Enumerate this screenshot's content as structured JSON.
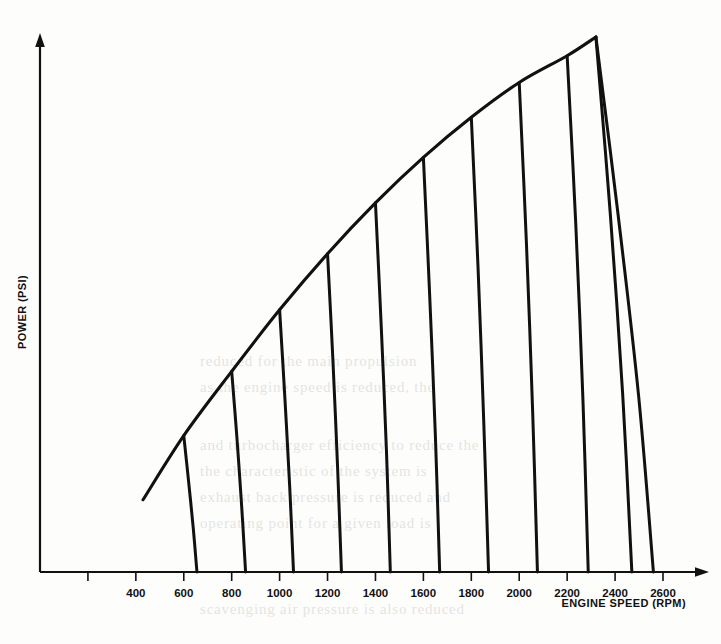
{
  "chart_data": {
    "type": "line",
    "title": "",
    "xlabel": "ENGINE SPEED (RPM)",
    "ylabel": "POWER (PSI)",
    "xlim": [
      0,
      2800
    ],
    "ylim": [
      0,
      100
    ],
    "grid": false,
    "legend": null,
    "xticks": [
      200,
      400,
      600,
      800,
      1000,
      1200,
      1400,
      1600,
      1800,
      2000,
      2200,
      2400,
      2600
    ],
    "xtick_labels": [
      "",
      "400",
      "600",
      "800",
      "1000",
      "1200",
      "1400",
      "1600",
      "1800",
      "2000",
      "2200",
      "2400",
      "2600"
    ],
    "yticks": [],
    "ytick_labels": [],
    "series": [
      {
        "name": "Full-load power envelope",
        "role": "envelope",
        "x": [
          430,
          600,
          800,
          1000,
          1200,
          1400,
          1600,
          1800,
          2000,
          2200,
          2320
        ],
        "y": [
          13.5,
          25.5,
          37.5,
          49.0,
          59.5,
          69.0,
          77.5,
          85.0,
          91.5,
          96.5,
          100.0
        ]
      },
      {
        "name": "Rack curve 600",
        "role": "drop",
        "branch_rpm": 600,
        "x": [
          600,
          620,
          640,
          655
        ],
        "y": [
          25.5,
          17.0,
          8.0,
          0.0
        ]
      },
      {
        "name": "Rack curve 800",
        "role": "drop",
        "branch_rpm": 800,
        "x": [
          800,
          822,
          842,
          858
        ],
        "y": [
          37.5,
          25.0,
          12.0,
          0.0
        ]
      },
      {
        "name": "Rack curve 1000",
        "role": "drop",
        "branch_rpm": 1000,
        "x": [
          1000,
          1022,
          1042,
          1058
        ],
        "y": [
          49.0,
          32.5,
          16.0,
          0.0
        ]
      },
      {
        "name": "Rack curve 1200",
        "role": "drop",
        "branch_rpm": 1200,
        "x": [
          1200,
          1222,
          1242,
          1258
        ],
        "y": [
          59.5,
          40.0,
          19.5,
          0.0
        ]
      },
      {
        "name": "Rack curve 1400",
        "role": "drop",
        "branch_rpm": 1400,
        "x": [
          1400,
          1424,
          1446,
          1462
        ],
        "y": [
          69.0,
          46.0,
          22.5,
          0.0
        ]
      },
      {
        "name": "Rack curve 1600",
        "role": "drop",
        "branch_rpm": 1600,
        "x": [
          1600,
          1626,
          1650,
          1668
        ],
        "y": [
          77.5,
          52.0,
          25.5,
          0.0
        ]
      },
      {
        "name": "Rack curve 1800",
        "role": "drop",
        "branch_rpm": 1800,
        "x": [
          1800,
          1828,
          1852,
          1872
        ],
        "y": [
          85.0,
          57.0,
          28.0,
          0.0
        ]
      },
      {
        "name": "Rack curve 2000",
        "role": "drop",
        "branch_rpm": 2000,
        "x": [
          2000,
          2030,
          2056,
          2076
        ],
        "y": [
          91.5,
          61.5,
          30.0,
          0.0
        ]
      },
      {
        "name": "Rack curve 2200",
        "role": "drop",
        "branch_rpm": 2200,
        "x": [
          2200,
          2236,
          2266,
          2288
        ],
        "y": [
          96.5,
          65.0,
          32.0,
          0.0
        ]
      },
      {
        "name": "Rack curve 2400",
        "role": "drop",
        "branch_rpm": 2320,
        "x": [
          2320,
          2380,
          2432,
          2470
        ],
        "y": [
          100.0,
          67.0,
          33.0,
          0.0
        ]
      },
      {
        "name": "Rack curve 2600",
        "role": "drop",
        "branch_rpm": 2320,
        "x": [
          2320,
          2412,
          2498,
          2560
        ],
        "y": [
          100.0,
          67.0,
          33.0,
          0.0
        ]
      }
    ]
  },
  "figure": {
    "x_axis_title": "ENGINE SPEED (RPM)",
    "y_axis_title": "POWER (PSI)"
  },
  "ghost_text": {
    "lines": [
      "reduced for the main propulsion",
      "as the engine speed is reduced, the",
      "and turbocharger efficiency to reduce the",
      "the characteristic of the system is",
      "exhaust back pressure is reduced and",
      "operating point for a given load is",
      "scavenging air pressure is also reduced"
    ]
  }
}
